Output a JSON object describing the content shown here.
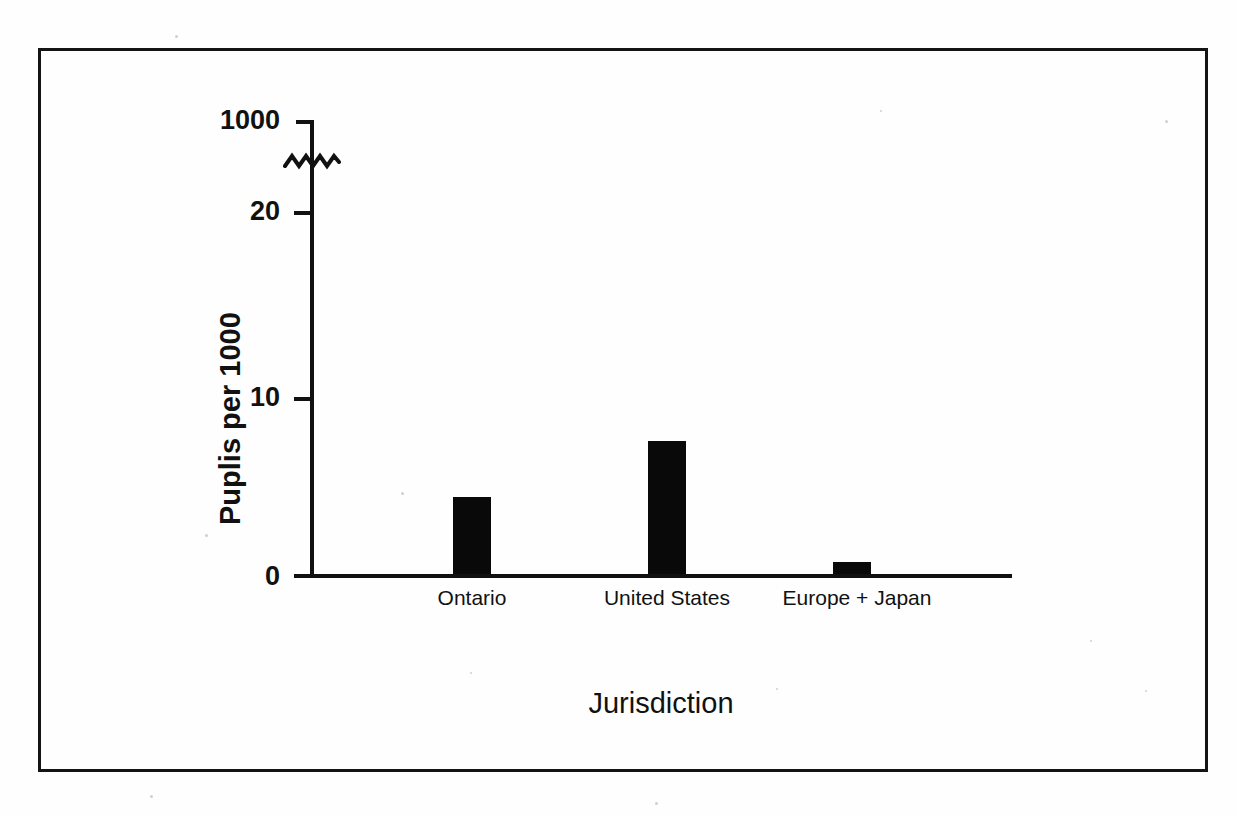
{
  "figure": {
    "frame": true
  },
  "chart_data": {
    "type": "bar",
    "title": "",
    "xlabel": "Jurisdiction",
    "ylabel": "Puplis per 1000",
    "categories": [
      "Ontario",
      "United States",
      "Europe + Japan"
    ],
    "values": [
      4.35,
      7.5,
      0.7
    ],
    "ytick_labels": [
      "0",
      "10",
      "20",
      "1000"
    ],
    "ytick_values": [
      0,
      10,
      20,
      1000
    ],
    "ylim": [
      0,
      1000
    ],
    "axis_break": {
      "present": true,
      "between": [
        20,
        1000
      ],
      "symbol": "zigzag"
    },
    "grid": false,
    "legend": null,
    "bar_color": "#090909",
    "axis_color": "#111111",
    "background": "#ffffff"
  }
}
